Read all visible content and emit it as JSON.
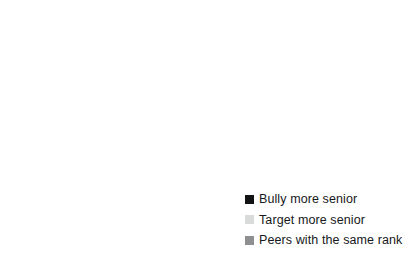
{
  "chart_data": {
    "type": "pie",
    "title": "",
    "subtitle": "",
    "xlabel": "",
    "ylabel": "",
    "grid": false,
    "legend_position": "bottom-right",
    "start_angle_deg": 0,
    "direction": "clockwise",
    "categories": [
      "Bully more senior",
      "Target more senior",
      "Peers with the same rank"
    ],
    "values": [
      84,
      3,
      13
    ],
    "unit": "%",
    "slices": [
      {
        "label": "Bully more senior",
        "value": 84,
        "color": "#0b0c0d",
        "start_deg": 0,
        "end_deg": 302.4
      },
      {
        "label": "Target more senior",
        "value": 3,
        "color": "#d6d7d8",
        "start_deg": 348.0,
        "end_deg": 360.0
      },
      {
        "label": "Peers with the same rank",
        "value": 13,
        "color": "#8f9193",
        "start_deg": 302.4,
        "end_deg": 348.0
      }
    ]
  },
  "legend": {
    "items": [
      {
        "label": "Bully more senior",
        "color": "#111214",
        "swatch": "legend-swatch-black"
      },
      {
        "label": "Target more senior",
        "color": "#d9dada",
        "swatch": "legend-swatch-light-gray"
      },
      {
        "label": "Peers with the same rank",
        "color": "#8d8f91",
        "swatch": "legend-swatch-gray"
      }
    ]
  },
  "colors": {
    "background": "#ffffff",
    "separator": "#ffffff",
    "text": "#16181a",
    "series_black": "#0b0c0d",
    "series_gray": "#8f9193",
    "series_light_gray": "#d6d7d8"
  }
}
